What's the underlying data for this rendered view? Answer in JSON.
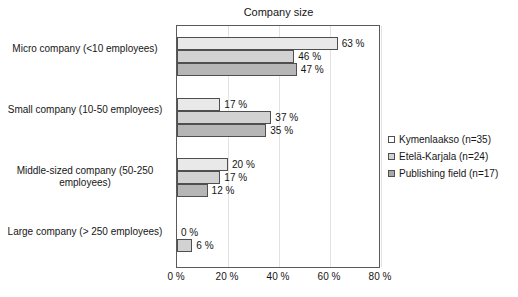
{
  "chart_data": {
    "type": "bar",
    "orientation": "horizontal",
    "title": "Company size",
    "xlabel": "",
    "ylabel": "",
    "xlim": [
      0,
      80
    ],
    "grid": true,
    "legend_position": "right",
    "tick_labels": [
      "0 %",
      "20 %",
      "40 %",
      "60 %",
      "80 %"
    ],
    "tick_values": [
      0,
      20,
      40,
      60,
      80
    ],
    "categories": [
      "Micro company (<10 employees)",
      "Small company (10-50 employees)",
      "Middle-sized company (50-250 employees)",
      "Large company (> 250 employees)"
    ],
    "series": [
      {
        "name": "Kymenlaakso (n=35)",
        "color": "#e9e9e9",
        "values": [
          63,
          17,
          20,
          0
        ],
        "labels": [
          "63 %",
          "17 %",
          "20 %",
          "0 %"
        ]
      },
      {
        "name": "Etelä-Karjala (n=24)",
        "color": "#d2d2d2",
        "values": [
          46,
          37,
          17,
          6
        ],
        "labels": [
          "46 %",
          "37 %",
          "17 %",
          "6 %"
        ]
      },
      {
        "name": "Publishing field (n=17)",
        "color": "#b6b6b6",
        "values": [
          47,
          35,
          12,
          null
        ],
        "labels": [
          "47 %",
          "35 %",
          "12 %",
          ""
        ]
      }
    ]
  }
}
